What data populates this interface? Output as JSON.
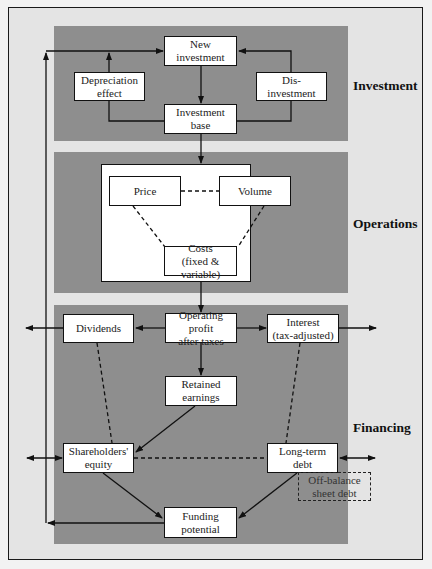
{
  "diagram": {
    "type": "flowchart",
    "sections": [
      {
        "id": "investment",
        "label": "Investment"
      },
      {
        "id": "operations",
        "label": "Operations"
      },
      {
        "id": "financing",
        "label": "Financing"
      }
    ],
    "nodes": {
      "new_investment": "New\ninvestment",
      "depreciation_effect": "Depreciation\neffect",
      "disinvestment": "Dis-\ninvestment",
      "investment_base": "Investment\nbase",
      "price": "Price",
      "volume": "Volume",
      "costs": "Costs\n(fixed & variable)",
      "operating_profit": "Operating profit\nafter taxes",
      "dividends": "Dividends",
      "interest": "Interest\n(tax-adjusted)",
      "retained_earnings": "Retained\nearnings",
      "shareholders_equity": "Shareholders'\nequity",
      "long_term_debt": "Long-term\ndebt",
      "off_balance_sheet_debt": "Off-balance\nsheet debt",
      "funding_potential": "Funding\npotential"
    },
    "edges": [
      {
        "from": "funding_potential",
        "to": "new_investment",
        "style": "solid",
        "note": "feedback loop via left side"
      },
      {
        "from": "depreciation_effect",
        "to": "new_investment",
        "style": "solid"
      },
      {
        "from": "disinvestment",
        "to": "new_investment",
        "style": "solid"
      },
      {
        "from": "new_investment",
        "to": "investment_base",
        "style": "solid"
      },
      {
        "from": "investment_base",
        "to": "depreciation_effect",
        "style": "solid"
      },
      {
        "from": "investment_base",
        "to": "disinvestment",
        "style": "solid"
      },
      {
        "from": "investment_base",
        "to": "operations",
        "style": "solid"
      },
      {
        "from": "price",
        "to": "volume",
        "style": "dashed"
      },
      {
        "from": "price",
        "to": "costs",
        "style": "dashed"
      },
      {
        "from": "volume",
        "to": "costs",
        "style": "dashed"
      },
      {
        "from": "operations",
        "to": "operating_profit",
        "style": "solid"
      },
      {
        "from": "operating_profit",
        "to": "dividends",
        "style": "solid"
      },
      {
        "from": "operating_profit",
        "to": "interest",
        "style": "solid"
      },
      {
        "from": "dividends",
        "to": "outside_left",
        "style": "solid"
      },
      {
        "from": "interest",
        "to": "outside_right",
        "style": "solid"
      },
      {
        "from": "operating_profit",
        "to": "retained_earnings",
        "style": "solid"
      },
      {
        "from": "retained_earnings",
        "to": "shareholders_equity",
        "style": "solid"
      },
      {
        "from": "dividends",
        "to": "shareholders_equity",
        "style": "dashed"
      },
      {
        "from": "interest",
        "to": "long_term_debt",
        "style": "dashed"
      },
      {
        "from": "shareholders_equity",
        "to": "long_term_debt",
        "style": "dashed"
      },
      {
        "from": "outside_left",
        "to": "shareholders_equity",
        "style": "solid",
        "bidirectional": true
      },
      {
        "from": "outside_right",
        "to": "long_term_debt",
        "style": "solid",
        "bidirectional": true
      },
      {
        "from": "shareholders_equity",
        "to": "funding_potential",
        "style": "solid"
      },
      {
        "from": "long_term_debt",
        "to": "funding_potential",
        "style": "solid"
      }
    ],
    "colors": {
      "page_background": "#f2f2f2",
      "frame_background": "#e4e4e4",
      "panel": "#8e8e8e",
      "box": "#ffffff",
      "stroke": "#111111"
    }
  }
}
